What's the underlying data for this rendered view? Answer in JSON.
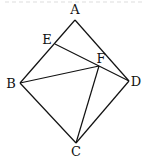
{
  "diagram": {
    "type": "geometry",
    "points": {
      "A": {
        "x": 75,
        "y": 20,
        "label": "A",
        "lx": 75,
        "ly": 14
      },
      "B": {
        "x": 20,
        "y": 83,
        "label": "B",
        "lx": 11,
        "ly": 88
      },
      "C": {
        "x": 76,
        "y": 143,
        "label": "C",
        "lx": 76,
        "ly": 156
      },
      "D": {
        "x": 129,
        "y": 81,
        "label": "D",
        "lx": 136,
        "ly": 86
      },
      "E": {
        "x": 55,
        "y": 44,
        "label": "E",
        "lx": 47,
        "ly": 44
      },
      "F": {
        "x": 99,
        "y": 66,
        "label": "F",
        "lx": 101,
        "ly": 63
      }
    },
    "segments": [
      [
        "A",
        "B"
      ],
      [
        "A",
        "D"
      ],
      [
        "B",
        "C"
      ],
      [
        "C",
        "D"
      ],
      [
        "E",
        "D"
      ],
      [
        "B",
        "F"
      ],
      [
        "C",
        "F"
      ]
    ]
  }
}
